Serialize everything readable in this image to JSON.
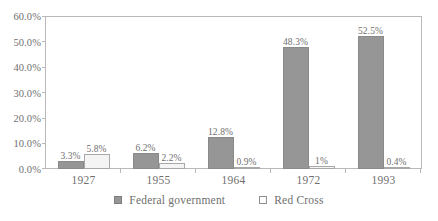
{
  "chart_data": {
    "type": "bar",
    "title": "",
    "subtitle": "",
    "xlabel": "",
    "ylabel": "",
    "categories": [
      "1927",
      "1955",
      "1964",
      "1972",
      "1993"
    ],
    "series": [
      {
        "name": "Federal government",
        "color": "#969696",
        "values": [
          3.3,
          6.2,
          12.8,
          48.3,
          52.5
        ],
        "labels": [
          "3.3%",
          "6.2%",
          "12.8%",
          "48.3%",
          "52.5%"
        ]
      },
      {
        "name": "Red Cross",
        "color": "#f4f4f4",
        "values": [
          5.8,
          2.2,
          0.9,
          1.0,
          0.4
        ],
        "labels": [
          "5.8%",
          "2.2%",
          "0.9%",
          "1%",
          "0.4%"
        ]
      }
    ],
    "ylim": [
      0,
      60
    ],
    "ytick_values": [
      0,
      10,
      20,
      30,
      40,
      50,
      60
    ],
    "ytick_labels": [
      "0.0%",
      "10.0%",
      "20.0%",
      "30.0%",
      "40.0%",
      "50.0%",
      "60.0%"
    ],
    "grid": false,
    "legend_position": "bottom",
    "legend_entries": [
      "Federal government",
      "Red Cross"
    ],
    "axis_color": "#b9b9b9",
    "text_color": "#6f6f6f"
  }
}
